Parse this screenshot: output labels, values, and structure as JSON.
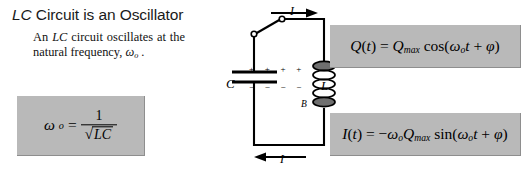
{
  "slide": {
    "title_italic": "LC",
    "title_rest": " Circuit is an Oscillator",
    "body_pre": "An ",
    "body_italic": "LC",
    "body_post": " circuit oscillates at the natural frequency, ",
    "body_omega": "ω",
    "body_omega_sub": "o",
    "body_end": " ."
  },
  "omega_box": {
    "lhs_symbol": "ω",
    "lhs_sub": "o",
    "equals": "=",
    "numerator": "1",
    "radical": "√",
    "denominator": "LC"
  },
  "equation_q": {
    "lhs_fn": "Q",
    "lhs_paren_open": "(",
    "lhs_var": "t",
    "lhs_paren_close": ")",
    "equals": "=",
    "amplitude": "Q",
    "amplitude_sub": "max",
    "trig": "cos(",
    "omega": "ω",
    "omega_sub": "o",
    "time": "t",
    "plus": " + ",
    "phase": "φ",
    "close": ")"
  },
  "equation_i": {
    "lhs_fn": "I",
    "lhs_paren_open": "(",
    "lhs_var": "t",
    "lhs_paren_close": ")",
    "equals": "=",
    "sign": "−",
    "omega_factor": "ω",
    "omega_factor_sub": "o",
    "amplitude": "Q",
    "amplitude_sub": "max",
    "trig": "sin(",
    "omega": "ω",
    "omega_sub": "o",
    "time": "t",
    "plus": " + ",
    "phase": "φ",
    "close": ")"
  },
  "circuit": {
    "capacitor_label": "C",
    "inductor_label": "L",
    "magnetic_field_label": "B",
    "current_top_label": "I",
    "current_bottom_label": "I",
    "plus_charges": "+  +  +  +",
    "minus_charges": "−  −  −  −"
  },
  "colors": {
    "box_fill": "#b9b9b9",
    "box_edge": "#8e8e8e",
    "background": "#ffffff",
    "ink": "#000000"
  }
}
